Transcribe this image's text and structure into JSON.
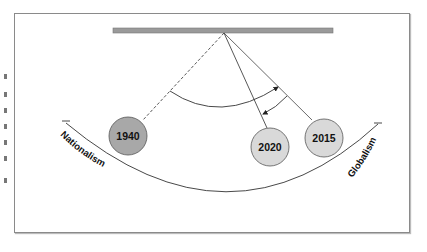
{
  "diagram": {
    "type": "pendulum",
    "scale_labels": {
      "left": "Nationalism",
      "right": "Globalism"
    },
    "bobs": [
      {
        "label": "1940",
        "fill": "#a8a8a8",
        "line": "dashed"
      },
      {
        "label": "2020",
        "fill": "#d9d9d9",
        "line": "solid"
      },
      {
        "label": "2015",
        "fill": "#d9d9d9",
        "line": "solid"
      }
    ],
    "colors": {
      "bar": "#8c8c8c",
      "line": "#333333",
      "dark_bob": "#a8a8a8",
      "light_bob": "#d9d9d9"
    }
  }
}
